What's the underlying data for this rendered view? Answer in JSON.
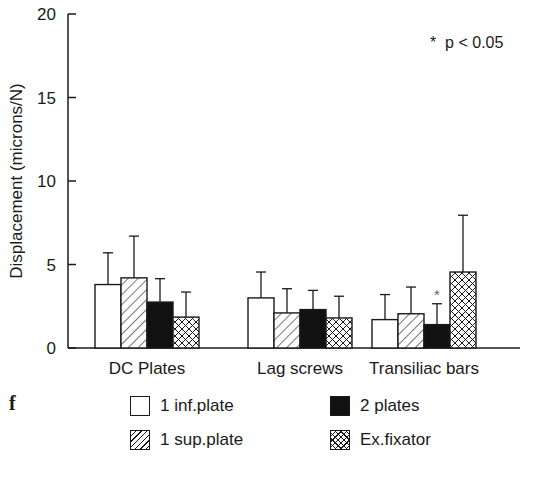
{
  "panel_letter": "f",
  "significance_note": "*  p < 0.05",
  "chart_data": {
    "type": "bar",
    "title": "",
    "xlabel": "",
    "ylabel": "Displacement (microns/N)",
    "ylim": [
      0,
      20
    ],
    "yticks": [
      0,
      5,
      10,
      15,
      20
    ],
    "grid": false,
    "legend_position": "bottom",
    "categories": [
      "DC Plates",
      "Lag screws",
      "Transiliac bars"
    ],
    "series": [
      {
        "name": "1 inf.plate",
        "pattern": "open",
        "values": [
          3.8,
          3.0,
          1.7
        ],
        "error_upper": [
          5.7,
          4.55,
          3.2
        ]
      },
      {
        "name": "1 sup.plate",
        "pattern": "diagonal-hatch",
        "values": [
          4.2,
          2.1,
          2.05
        ],
        "error_upper": [
          6.7,
          3.55,
          3.65
        ]
      },
      {
        "name": "2 plates",
        "pattern": "solid-black",
        "values": [
          2.75,
          2.3,
          1.4
        ],
        "error_upper": [
          4.15,
          3.45,
          2.65
        ]
      },
      {
        "name": "Ex.fixator",
        "pattern": "cross-hatch",
        "values": [
          1.85,
          1.8,
          4.55
        ],
        "error_upper": [
          3.35,
          3.1,
          7.95
        ]
      }
    ],
    "annotations": [
      {
        "text": "*",
        "category": "Transiliac bars",
        "series": "2 plates",
        "meaning": "p < 0.05"
      },
      {
        "text": "* p < 0.05",
        "position": "top-right"
      }
    ]
  },
  "legend": [
    {
      "label": "1 inf.plate",
      "pattern": "open"
    },
    {
      "label": "2 plates",
      "pattern": "solid-black"
    },
    {
      "label": "1 sup.plate",
      "pattern": "diagonal-hatch"
    },
    {
      "label": "Ex.fixator",
      "pattern": "cross-hatch"
    }
  ]
}
